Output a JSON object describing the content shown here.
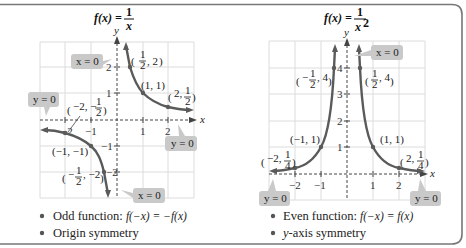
{
  "panels": [
    {
      "title_lhs": "f(x) =",
      "title_num": "1",
      "title_den": "x",
      "axis_x": "x",
      "axis_y": "y",
      "x_ticks": [
        "−2",
        "−1",
        "1",
        "2"
      ],
      "y_ticks": [
        "2",
        "1",
        "−1",
        "−2"
      ],
      "points": [
        {
          "label": "(1/2, 2)",
          "pre": "(",
          "num": "1",
          "den": "2",
          "post": ", 2)"
        },
        {
          "label": "(1, 1)",
          "text": "(1, 1)"
        },
        {
          "label": "(2, 1/2)",
          "pre": "(2, ",
          "num": "1",
          "den": "2",
          "post": ")"
        },
        {
          "label": "(−2, −1/2)",
          "pre": "(−2, −",
          "num": "1",
          "den": "2",
          "post": ")"
        },
        {
          "label": "(−1, −1)",
          "text": "(−1, −1)"
        },
        {
          "label": "(−1/2, −2)",
          "pre": "(−",
          "num": "1",
          "den": "2",
          "post": ", −2)"
        }
      ],
      "callouts": [
        "x = 0",
        "y = 0",
        "y = 0",
        "x = 0"
      ],
      "bullets": [
        {
          "text": "Odd function: ",
          "formula": "f(−x) = −f(x)"
        },
        {
          "text": "Origin symmetry",
          "formula": ""
        }
      ]
    },
    {
      "title_lhs": "f(x) =",
      "title_num": "1",
      "title_den": "x",
      "title_exp": "2",
      "axis_x": "x",
      "axis_y": "y",
      "x_ticks": [
        "−2",
        "−1",
        "1",
        "2"
      ],
      "y_ticks": [
        "4",
        "3",
        "2",
        "1"
      ],
      "points": [
        {
          "label": "(−1/2, 4)",
          "pre": "(−",
          "num": "1",
          "den": "2",
          "post": ", 4)"
        },
        {
          "label": "(1/2, 4)",
          "pre": "(",
          "num": "1",
          "den": "2",
          "post": ", 4)"
        },
        {
          "label": "(−1, 1)",
          "text": "(−1, 1)"
        },
        {
          "label": "(1, 1)",
          "text": "(1, 1)"
        },
        {
          "label": "(−2, 1/4)",
          "pre": "(−2, ",
          "num": "1",
          "den": "4",
          "post": ")"
        },
        {
          "label": "(2, 1/4)",
          "pre": "(2, ",
          "num": "1",
          "den": "4",
          "post": ")"
        }
      ],
      "callouts": [
        "x = 0",
        "y = 0",
        "y = 0"
      ],
      "bullets": [
        {
          "text": "Even function: ",
          "formula": "f(−x) = f(x)"
        },
        {
          "text": "-axis symmetry",
          "prefix": "y"
        }
      ]
    }
  ],
  "colors": {
    "curve": "#5a5a5a",
    "callout_bg": "#c9c9c9",
    "grid": "#dcdcdc",
    "frame": "#777777"
  }
}
